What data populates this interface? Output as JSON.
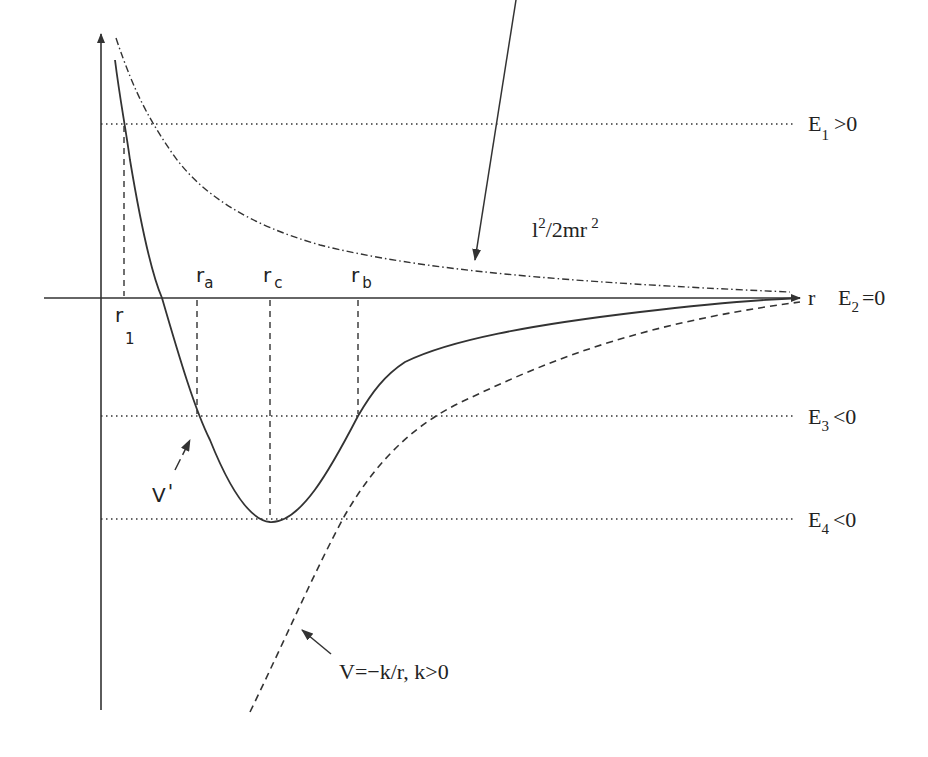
{
  "diagram": {
    "axes": {
      "x_label": "r",
      "y_label": ""
    },
    "energy_levels": [
      {
        "id": "E1",
        "base": "E",
        "sub": "1",
        "condition": ">0"
      },
      {
        "id": "E2",
        "base": "E",
        "sub": "2",
        "condition": "=0"
      },
      {
        "id": "E3",
        "base": "E",
        "sub": "3",
        "condition": "<0"
      },
      {
        "id": "E4",
        "base": "E",
        "sub": "4",
        "condition": "<0"
      }
    ],
    "radii": [
      {
        "id": "r1",
        "base": "r",
        "sub": "1"
      },
      {
        "id": "ra",
        "base": "r",
        "sub": "a"
      },
      {
        "id": "rc",
        "base": "r",
        "sub": "c"
      },
      {
        "id": "rb",
        "base": "r",
        "sub": "b"
      }
    ],
    "curves": {
      "centrifugal": {
        "label_l": "l",
        "label_sup1": "2",
        "label_mid": "/2mr",
        "label_sup2": "2",
        "style": "dash-dot"
      },
      "effective": {
        "label": "V",
        "label_prime": "'",
        "style": "solid"
      },
      "coulomb": {
        "label": "V=−k/r, k>0",
        "style": "dashed"
      }
    }
  }
}
